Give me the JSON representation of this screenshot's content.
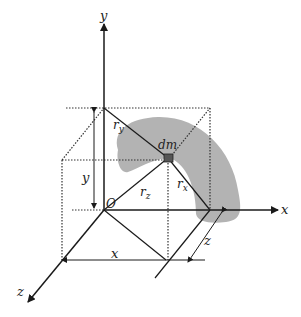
{
  "diagram": {
    "title": "",
    "labels": {
      "y_axis": "y",
      "x_axis": "x",
      "z_axis": "z",
      "origin": "O",
      "mass_element": "dm",
      "r_y_main": "r",
      "r_y_sub": "y",
      "r_x_main": "r",
      "r_x_sub": "x",
      "r_z_main": "r",
      "r_z_sub": "z",
      "dim_y": "y",
      "dim_x": "x",
      "dim_z": "z"
    },
    "colors": {
      "line": "#1a1a1a",
      "dotted": "#333333",
      "body_fill": "#b3b3b3",
      "dm_fill": "#555555",
      "background": "#ffffff"
    }
  }
}
